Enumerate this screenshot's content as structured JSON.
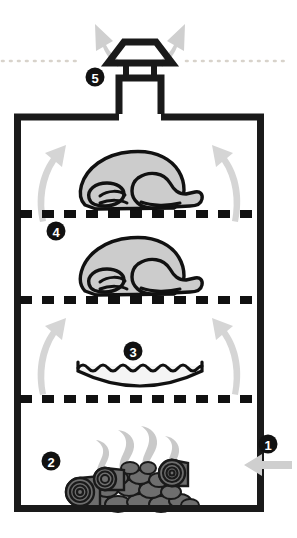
{
  "diagram": {
    "background_color": "#ffffff",
    "outline_color": "#1a1a1a",
    "fill_gray": "#cccccc",
    "arrow_gray": "#cfcfcf",
    "coal_gray": "#6e6e6e",
    "dotted_line_color": "#d8d3cb",
    "badge_fill": "#111111",
    "badge_text_color": "#ffffff"
  },
  "callouts": [
    {
      "id": "callout-1",
      "number": "1",
      "name": "air-intake-vent",
      "label": "Air intake",
      "cx": 268,
      "cy": 444,
      "r": 9.5
    },
    {
      "id": "callout-2",
      "number": "2",
      "name": "charcoal-fire-chamber",
      "label": "Charcoal fire",
      "cx": 51,
      "cy": 461,
      "r": 9.5
    },
    {
      "id": "callout-3",
      "number": "3",
      "name": "water-pan",
      "label": "Water pan",
      "cx": 133,
      "cy": 351,
      "r": 9.5
    },
    {
      "id": "callout-4",
      "number": "4",
      "name": "cooking-grates",
      "label": "Cooking grates with meat",
      "cx": 56,
      "cy": 231,
      "r": 9.5
    },
    {
      "id": "callout-5",
      "number": "5",
      "name": "exhaust-chimney-vent",
      "label": "Exhaust chimney",
      "cx": 95,
      "cy": 77,
      "r": 9.5
    }
  ],
  "parts": {
    "body": {
      "name": "smoker-body",
      "x": 14,
      "y": 114,
      "width": 250,
      "height": 398,
      "stroke_width": 7
    },
    "chimney": {
      "name": "chimney-stack",
      "neck_top": 78,
      "cap_top": 41
    },
    "grates": [
      {
        "name": "upper-grate",
        "y": 214
      },
      {
        "name": "middle-grate",
        "y": 300
      },
      {
        "name": "lower-grate",
        "y": 399
      }
    ],
    "birds": [
      {
        "name": "turkey-upper",
        "cx": 137,
        "cy": 186
      },
      {
        "name": "turkey-lower",
        "cx": 137,
        "cy": 272
      }
    ],
    "water_pan": {
      "name": "water-pan-shape",
      "cx": 140,
      "cy": 374
    },
    "coals": {
      "name": "charcoal-pile",
      "cx": 128,
      "cy": 486
    },
    "smoke": {
      "name": "smoke-wisps",
      "cx": 128,
      "cy": 460
    },
    "convection_arrows": [
      {
        "name": "convection-arrow-left-upper"
      },
      {
        "name": "convection-arrow-right-upper"
      },
      {
        "name": "convection-arrow-left-lower"
      },
      {
        "name": "convection-arrow-right-lower"
      }
    ],
    "exhaust_arrows": [
      {
        "name": "exhaust-arrow-left"
      },
      {
        "name": "exhaust-arrow-right"
      }
    ],
    "intake_arrow": {
      "name": "intake-arrow"
    },
    "guide_lines": [
      {
        "name": "guide-dotted-line-left"
      },
      {
        "name": "guide-dotted-line-right"
      }
    ]
  }
}
